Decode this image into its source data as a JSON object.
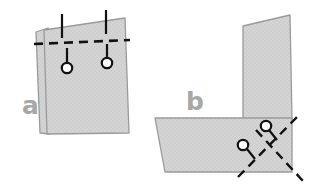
{
  "figure": {
    "background_color": "#ffffff",
    "sheet_fill": "#d4d4d4",
    "sheet_stroke": "#9a9a9a",
    "annotation_color": "#111111",
    "label_color": "#a8a8a8"
  },
  "panels": [
    {
      "id": "a",
      "label": "a",
      "label_x": 22,
      "label_y": 114,
      "description": "lap joint of two overlapping plates with horizontal dashed weld line and two tack indicators",
      "sheets": [
        {
          "name": "back-plate",
          "points": "36,32 48,28 50,134 40,133"
        },
        {
          "name": "front-plate",
          "points": "44,30 125,18 129,133 47,134"
        }
      ],
      "dashed_line": {
        "name": "weld-seam",
        "x1": 34,
        "y1": 44,
        "x2": 130,
        "y2": 40
      },
      "indicators": [
        {
          "name": "tack-indicator-left",
          "circle_cx": 67,
          "circle_cy": 68,
          "circle_r": 5.2,
          "stem_x1": 67,
          "stem_y1": 63,
          "stem_x2": 67,
          "stem_y2": 48,
          "lead_x1": 62,
          "lead_y1": 38,
          "lead_x2": 62,
          "lead_y2": 14
        },
        {
          "name": "tack-indicator-right",
          "circle_cx": 107,
          "circle_cy": 63,
          "circle_r": 5.2,
          "stem_x1": 107,
          "stem_y1": 58,
          "stem_x2": 107,
          "stem_y2": 44,
          "lead_x1": 106,
          "lead_y1": 34,
          "lead_x2": 106,
          "lead_y2": 10
        }
      ]
    },
    {
      "id": "b",
      "label": "b",
      "label_x": 186,
      "label_y": 110,
      "description": "T-joint with a vertical web plate standing on a horizontal flange plate, crossed dashed weld lines and two tack indicators",
      "sheets": [
        {
          "name": "vertical-web-plate",
          "points": "243,26 290,15 292,120 243,120"
        },
        {
          "name": "horizontal-flange-plate",
          "points": "155,118 292,118 292,172 165,172"
        }
      ],
      "dashed_lines": [
        {
          "name": "weld-seam-primary",
          "x1": 238,
          "y1": 177,
          "x2": 298,
          "y2": 116
        },
        {
          "name": "weld-seam-secondary",
          "x1": 256,
          "y1": 130,
          "x2": 303,
          "y2": 181
        }
      ],
      "indicators": [
        {
          "name": "tack-indicator-lower-left",
          "circle_cx": 243,
          "circle_cy": 145,
          "circle_r": 5.2,
          "stem_x1": 247,
          "stem_y1": 149,
          "stem_x2": 255,
          "stem_y2": 159
        },
        {
          "name": "tack-indicator-upper-right",
          "circle_cx": 266,
          "circle_cy": 126,
          "circle_r": 5.2,
          "stem_x1": 269,
          "stem_y1": 130,
          "stem_x2": 277,
          "stem_y2": 140
        }
      ]
    }
  ]
}
